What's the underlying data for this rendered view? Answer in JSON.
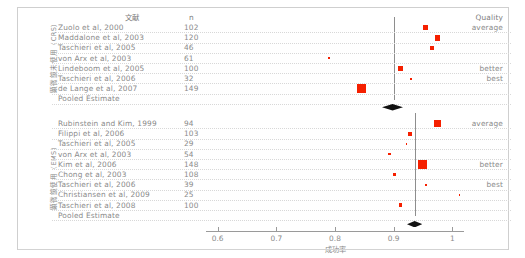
{
  "figure": {
    "width": 525,
    "height": 258,
    "background": "#ffffff",
    "marker_color": "#f52000",
    "diamond_color": "#111111",
    "text_color": "#8a8a8a"
  },
  "headers": {
    "study": "文献",
    "n": "n",
    "quality": "Quality"
  },
  "axis": {
    "label": "成功率",
    "ticks": [
      "0.6",
      "0.7",
      "0.8",
      "0.9",
      "1"
    ],
    "tick_values": [
      0.6,
      0.7,
      0.8,
      0.9,
      1.0
    ],
    "min": 0.58,
    "max": 1.02
  },
  "groups": [
    {
      "id": "group-crs",
      "vertical_label": "顕微鏡未使用（CRS）",
      "reference_value": 0.9,
      "quality_labels": [
        {
          "row": 0,
          "text": "average"
        },
        {
          "row": 4,
          "text": "better"
        },
        {
          "row": 5,
          "text": "best"
        }
      ],
      "rows": [
        {
          "study": "Zuolo et al, 2000",
          "n": "102",
          "value": 0.955,
          "size": 5.0
        },
        {
          "study": "Maddalone et al, 2003",
          "n": "120",
          "value": 0.975,
          "size": 5.5
        },
        {
          "study": "Taschieri et al, 2005",
          "n": "46",
          "value": 0.965,
          "size": 4.0
        },
        {
          "study": "von Arx et al, 2003",
          "n": "61",
          "value": 0.79,
          "size": 1.8
        },
        {
          "study": "Lindeboom et al, 2005",
          "n": "100",
          "value": 0.912,
          "size": 4.6
        },
        {
          "study": "Taschieri et al, 2006",
          "n": "32",
          "value": 0.93,
          "size": 2.0
        },
        {
          "study": "de Lange et al, 2007",
          "n": "149",
          "value": 0.845,
          "size": 9.0
        }
      ],
      "pooled": {
        "label": "Pooled Estimate",
        "value": 0.898,
        "half_width": 0.018
      }
    },
    {
      "id": "group-em",
      "vertical_label": "顕微鏡使用（EMS）",
      "reference_value": 0.936,
      "quality_labels": [
        {
          "row": 0,
          "text": "average"
        },
        {
          "row": 4,
          "text": "better"
        },
        {
          "row": 6,
          "text": "best"
        }
      ],
      "rows": [
        {
          "study": "Rubinstein and Kim, 1999",
          "n": "94",
          "value": 0.975,
          "size": 7.5
        },
        {
          "study": "Filippi et al, 2006",
          "n": "103",
          "value": 0.928,
          "size": 4.5
        },
        {
          "study": "Taschieri et al, 2005",
          "n": "29",
          "value": 0.922,
          "size": 1.6
        },
        {
          "study": "von Arx et al, 2003",
          "n": "54",
          "value": 0.893,
          "size": 2.6
        },
        {
          "study": "Kim et al, 2006",
          "n": "148",
          "value": 0.949,
          "size": 8.6
        },
        {
          "study": "Chong et al, 2003",
          "n": "108",
          "value": 0.902,
          "size": 3.4
        },
        {
          "study": "Taschieri et al, 2006",
          "n": "39",
          "value": 0.955,
          "size": 2.4
        },
        {
          "study": "Christiansen  et al, 2009",
          "n": "25",
          "value": 1.012,
          "size": 1.6
        },
        {
          "study": "Taschieri et al, 2008",
          "n": "100",
          "value": 0.912,
          "size": 3.6
        }
      ],
      "pooled": {
        "label": "Pooled Estimate",
        "value": 0.936,
        "half_width": 0.013
      }
    }
  ]
}
